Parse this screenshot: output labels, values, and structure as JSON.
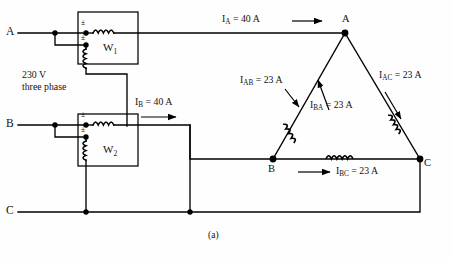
{
  "figure": {
    "caption": "(a)",
    "source_label_line1": "230 V",
    "source_label_line2": "three phase"
  },
  "supply_terminals": [
    {
      "name": "A",
      "label": "A"
    },
    {
      "name": "B",
      "label": "B"
    },
    {
      "name": "C",
      "label": "C"
    }
  ],
  "wattmeters": [
    {
      "name": "W1",
      "label": "W",
      "sub": "1",
      "polarity_current": "±",
      "polarity_voltage": "±"
    },
    {
      "name": "W2",
      "label": "W",
      "sub": "2",
      "polarity_current": "±",
      "polarity_voltage": "±"
    }
  ],
  "load": {
    "type": "delta",
    "vertices": [
      {
        "name": "A",
        "label": "A"
      },
      {
        "name": "B",
        "label": "B"
      },
      {
        "name": "C",
        "label": "C"
      }
    ]
  },
  "currents": {
    "line_a": {
      "symbol": "I",
      "sub": "A",
      "eq": "=",
      "value": "40",
      "unit": "A",
      "text": "I_A = 40 A"
    },
    "line_b": {
      "symbol": "I",
      "sub": "B",
      "eq": "=",
      "value": "40",
      "unit": "A",
      "text": "I_B = 40 A"
    },
    "phase_ab": {
      "symbol": "I",
      "sub": "AB",
      "eq": "=",
      "value": "23",
      "unit": "A",
      "text": "I_AB = 23 A"
    },
    "phase_ba": {
      "symbol": "I",
      "sub": "BA",
      "eq": "=",
      "value": "23",
      "unit": "A",
      "text": "I_BA = 23 A"
    },
    "phase_ac": {
      "symbol": "I",
      "sub": "AC",
      "eq": "=",
      "value": "23",
      "unit": "A",
      "text": "I_AC = 23 A"
    },
    "phase_bc": {
      "symbol": "I",
      "sub": "BC",
      "eq": "=",
      "value": "23",
      "unit": "A",
      "text": "I_BC = 23 A"
    }
  },
  "colors": {
    "wire": "#000000",
    "background": "#fefefe",
    "text": "#111111"
  }
}
